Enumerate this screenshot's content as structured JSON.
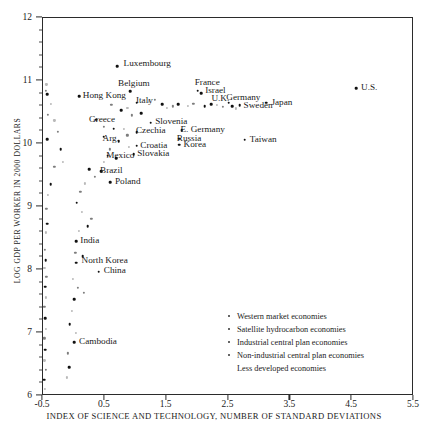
{
  "chart_data": {
    "type": "scatter",
    "title": "",
    "xlabel": "INDEX OF SCIENCE AND TECHNOLOGY, NUMBER OF STANDARD DEVIATIONS",
    "ylabel": "LOG GDP PER WORKER IN 2000 DOLLARS",
    "xlim": [
      -0.5,
      5.5
    ],
    "ylim": [
      6,
      12
    ],
    "xticks": [
      -0.5,
      0.5,
      1.5,
      2.5,
      3.5,
      4.5,
      5.5
    ],
    "xtick_labels": [
      "-0.5",
      "0.5",
      "1.5",
      "2.5",
      "3.5",
      "4.5",
      "5.5"
    ],
    "yticks": [
      6,
      7,
      8,
      9,
      10,
      11,
      12
    ],
    "ytick_labels": [
      "6",
      "7",
      "8",
      "9",
      "10",
      "11",
      "12"
    ],
    "grid": false,
    "legend_position": "inside lower-right",
    "labeled_points": [
      {
        "label": "Luxembourg",
        "x": 0.72,
        "y": 11.22,
        "lx": 0.82,
        "ly": 11.25
      },
      {
        "label": "Belgium",
        "x": 0.93,
        "y": 10.82,
        "lx": 0.73,
        "ly": 10.94
      },
      {
        "label": "France",
        "x": 2.02,
        "y": 10.83,
        "lx": 1.97,
        "ly": 10.95
      },
      {
        "label": "Israel",
        "x": 2.07,
        "y": 10.79,
        "lx": 2.14,
        "ly": 10.82
      },
      {
        "label": "Hong Kong",
        "x": 0.1,
        "y": 10.74,
        "lx": 0.16,
        "ly": 10.74
      },
      {
        "label": "Italy",
        "x": 1.03,
        "y": 10.64,
        "lx": 1.02,
        "ly": 10.67
      },
      {
        "label": "U.K.",
        "x": 2.24,
        "y": 10.62,
        "lx": 2.24,
        "ly": 10.7
      },
      {
        "label": "Germany",
        "x": 2.52,
        "y": 10.64,
        "lx": 2.48,
        "ly": 10.71
      },
      {
        "label": "Sweden",
        "x": 2.7,
        "y": 10.6,
        "lx": 2.76,
        "ly": 10.59
      },
      {
        "label": "Japan",
        "x": 3.13,
        "y": 10.64,
        "lx": 3.21,
        "ly": 10.64
      },
      {
        "label": "U.S.",
        "x": 4.58,
        "y": 10.87,
        "lx": 4.66,
        "ly": 10.87
      },
      {
        "label": "Greece",
        "x": 0.38,
        "y": 10.37,
        "lx": 0.26,
        "ly": 10.37
      },
      {
        "label": "Slovenia",
        "x": 1.26,
        "y": 10.32,
        "lx": 1.33,
        "ly": 10.33
      },
      {
        "label": "Czechia",
        "x": 1.03,
        "y": 10.17,
        "lx": 1.02,
        "ly": 10.19
      },
      {
        "label": "E. Germany",
        "x": 1.76,
        "y": 10.2,
        "lx": 1.74,
        "ly": 10.2
      },
      {
        "label": "Arg.",
        "x": 0.5,
        "y": 10.1,
        "lx": 0.48,
        "ly": 10.07
      },
      {
        "label": "Russia",
        "x": 1.72,
        "y": 10.07,
        "lx": 1.68,
        "ly": 10.07
      },
      {
        "label": "Taiwan",
        "x": 2.78,
        "y": 10.05,
        "lx": 2.86,
        "ly": 10.05
      },
      {
        "label": "Croatia",
        "x": 1.03,
        "y": 9.96,
        "lx": 1.09,
        "ly": 9.96
      },
      {
        "label": "Korea",
        "x": 1.72,
        "y": 9.97,
        "lx": 1.79,
        "ly": 9.97
      },
      {
        "label": "Mexico",
        "x": 0.56,
        "y": 9.8,
        "lx": 0.54,
        "ly": 9.8
      },
      {
        "label": "Slovakia",
        "x": 0.98,
        "y": 9.82,
        "lx": 1.04,
        "ly": 9.82
      },
      {
        "label": "Brazil",
        "x": 0.46,
        "y": 9.55,
        "lx": 0.44,
        "ly": 9.55
      },
      {
        "label": "Poland",
        "x": 0.6,
        "y": 9.38,
        "lx": 0.68,
        "ly": 9.38
      },
      {
        "label": "India",
        "x": 0.05,
        "y": 8.44,
        "lx": 0.12,
        "ly": 8.44
      },
      {
        "label": "North Korea",
        "x": 0.05,
        "y": 8.1,
        "lx": 0.14,
        "ly": 8.12
      },
      {
        "label": "China",
        "x": 0.42,
        "y": 7.96,
        "lx": 0.5,
        "ly": 7.97
      },
      {
        "label": "Cambodia",
        "x": 0.02,
        "y": 6.84,
        "lx": 0.1,
        "ly": 6.84
      }
    ],
    "unlabeled_points": [
      {
        "x": -0.43,
        "y": 10.93
      },
      {
        "x": -0.44,
        "y": 10.83
      },
      {
        "x": -0.42,
        "y": 10.77
      },
      {
        "x": -0.36,
        "y": 10.62
      },
      {
        "x": -0.4,
        "y": 10.45
      },
      {
        "x": -0.42,
        "y": 10.06
      },
      {
        "x": -0.3,
        "y": 10.36
      },
      {
        "x": -0.24,
        "y": 10.18
      },
      {
        "x": -0.2,
        "y": 9.9
      },
      {
        "x": -0.16,
        "y": 9.7
      },
      {
        "x": -0.3,
        "y": 9.62
      },
      {
        "x": -0.36,
        "y": 9.35
      },
      {
        "x": -0.4,
        "y": 9.17
      },
      {
        "x": -0.43,
        "y": 8.96
      },
      {
        "x": -0.42,
        "y": 8.72
      },
      {
        "x": -0.44,
        "y": 8.58
      },
      {
        "x": -0.45,
        "y": 8.3
      },
      {
        "x": -0.44,
        "y": 8.14
      },
      {
        "x": -0.46,
        "y": 8.02
      },
      {
        "x": -0.43,
        "y": 7.88
      },
      {
        "x": -0.45,
        "y": 7.72
      },
      {
        "x": -0.44,
        "y": 7.55
      },
      {
        "x": -0.46,
        "y": 7.4
      },
      {
        "x": -0.45,
        "y": 7.22
      },
      {
        "x": -0.44,
        "y": 7.05
      },
      {
        "x": -0.46,
        "y": 6.9
      },
      {
        "x": -0.45,
        "y": 6.72
      },
      {
        "x": -0.46,
        "y": 6.55
      },
      {
        "x": -0.44,
        "y": 6.4
      },
      {
        "x": -0.46,
        "y": 6.24
      },
      {
        "x": -0.45,
        "y": 6.1
      },
      {
        "x": 0.62,
        "y": 10.6
      },
      {
        "x": 0.78,
        "y": 10.52
      },
      {
        "x": 0.88,
        "y": 10.56
      },
      {
        "x": 0.95,
        "y": 10.44
      },
      {
        "x": 1.1,
        "y": 10.47
      },
      {
        "x": 1.23,
        "y": 10.66
      },
      {
        "x": 1.33,
        "y": 10.68
      },
      {
        "x": 1.44,
        "y": 10.62
      },
      {
        "x": 1.52,
        "y": 10.56
      },
      {
        "x": 1.62,
        "y": 10.58
      },
      {
        "x": 1.7,
        "y": 10.62
      },
      {
        "x": 1.86,
        "y": 10.59
      },
      {
        "x": 1.95,
        "y": 10.62
      },
      {
        "x": 2.13,
        "y": 10.58
      },
      {
        "x": 2.33,
        "y": 10.61
      },
      {
        "x": 2.42,
        "y": 10.57
      },
      {
        "x": 2.58,
        "y": 10.58
      },
      {
        "x": 2.64,
        "y": 10.55
      },
      {
        "x": 0.5,
        "y": 10.26
      },
      {
        "x": 0.66,
        "y": 10.23
      },
      {
        "x": 0.82,
        "y": 10.22
      },
      {
        "x": 0.88,
        "y": 10.12
      },
      {
        "x": 0.74,
        "y": 10.03
      },
      {
        "x": 0.9,
        "y": 9.94
      },
      {
        "x": 0.6,
        "y": 9.9
      },
      {
        "x": 0.7,
        "y": 9.76
      },
      {
        "x": 0.5,
        "y": 9.7
      },
      {
        "x": 0.36,
        "y": 9.46
      },
      {
        "x": 0.26,
        "y": 9.58
      },
      {
        "x": 0.2,
        "y": 9.36
      },
      {
        "x": 0.12,
        "y": 9.22
      },
      {
        "x": 0.06,
        "y": 9.05
      },
      {
        "x": 0.15,
        "y": 8.9
      },
      {
        "x": 0.3,
        "y": 8.8
      },
      {
        "x": 0.24,
        "y": 8.68
      },
      {
        "x": 0.1,
        "y": 8.6
      },
      {
        "x": 0.04,
        "y": 8.26
      },
      {
        "x": 0.16,
        "y": 8.2
      },
      {
        "x": 0.0,
        "y": 7.84
      },
      {
        "x": 0.08,
        "y": 7.7
      },
      {
        "x": 0.02,
        "y": 7.52
      },
      {
        "x": -0.02,
        "y": 7.34
      },
      {
        "x": 0.18,
        "y": 7.62
      },
      {
        "x": -0.05,
        "y": 7.12
      },
      {
        "x": 0.05,
        "y": 6.98
      },
      {
        "x": -0.08,
        "y": 6.66
      },
      {
        "x": -0.06,
        "y": 6.44
      },
      {
        "x": -0.1,
        "y": 6.28
      }
    ],
    "legend_entries": [
      {
        "label": "Western market economies",
        "marker": true
      },
      {
        "label": "Satellite hydrocarbon economies",
        "marker": true
      },
      {
        "label": "Industrial central plan economies",
        "marker": true
      },
      {
        "label": "Non-industrial central plan economies",
        "marker": true
      },
      {
        "label": "Less developed economies",
        "marker": false
      }
    ]
  }
}
